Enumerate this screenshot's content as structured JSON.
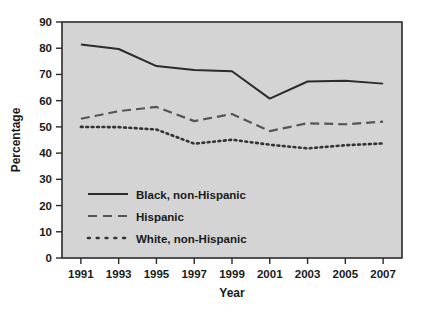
{
  "chart_data": {
    "type": "line",
    "title": "",
    "xlabel": "Year",
    "ylabel": "Percentage",
    "x": [
      1991,
      1993,
      1995,
      1997,
      1999,
      2001,
      2003,
      2005,
      2007
    ],
    "xtick_labels": [
      "1991",
      "1993",
      "1995",
      "1997",
      "1999",
      "2001",
      "2003",
      "2005",
      "2007"
    ],
    "ytick_labels": [
      "0",
      "10",
      "20",
      "30",
      "40",
      "50",
      "60",
      "70",
      "80",
      "90"
    ],
    "yticks": [
      0,
      10,
      20,
      30,
      40,
      50,
      60,
      70,
      80,
      90
    ],
    "xlim": [
      1990,
      2008
    ],
    "ylim": [
      0,
      90
    ],
    "grid": false,
    "legend_position": "inside-lower-left",
    "series": [
      {
        "name": "Black, non-Hispanic",
        "style": "solid",
        "color": "#2b2b2b",
        "values": [
          81.4,
          79.7,
          73.2,
          71.7,
          71.2,
          60.8,
          67.3,
          67.6,
          66.5
        ]
      },
      {
        "name": "Hispanic",
        "style": "dashed",
        "color": "#555555",
        "values": [
          53.1,
          56.0,
          57.6,
          52.2,
          54.9,
          48.4,
          51.4,
          51.0,
          52.0
        ]
      },
      {
        "name": "White, non-Hispanic",
        "style": "dotted",
        "color": "#333333",
        "values": [
          50.0,
          49.9,
          49.0,
          43.6,
          45.1,
          43.2,
          41.8,
          43.0,
          43.7
        ]
      }
    ]
  },
  "axes": {
    "y_title": "Percentage",
    "x_title": "Year"
  },
  "legend": {
    "items": [
      {
        "label": "Black, non-Hispanic",
        "style": "solid"
      },
      {
        "label": "Hispanic",
        "style": "dashed"
      },
      {
        "label": "White, non-Hispanic",
        "style": "dotted"
      }
    ]
  },
  "colors": {
    "plot_background": "#d4d4d4",
    "page_background": "#ffffff",
    "axis": "#2b2b2b",
    "text": "#1a1a1a"
  }
}
